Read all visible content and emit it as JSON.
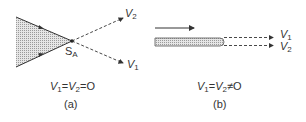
{
  "panels": [
    {
      "id": "a",
      "caption": "(a)",
      "equation": {
        "v1": "V",
        "v1_sub": "1",
        "eq1": "=",
        "v2": "V",
        "v2_sub": "2",
        "eq2": "=",
        "rhs": "O"
      },
      "point_label": {
        "main": "S",
        "sub": "A"
      },
      "line_labels": {
        "upper": {
          "main": "V",
          "sub": "2"
        },
        "lower": {
          "main": "V",
          "sub": "1"
        }
      }
    },
    {
      "id": "b",
      "caption": "(b)",
      "equation": {
        "v1": "V",
        "v1_sub": "1",
        "eq1": "=",
        "v2": "V",
        "v2_sub": "2",
        "eq2": "≠",
        "rhs": "O"
      },
      "line_labels": {
        "upper": {
          "main": "V",
          "sub": "1"
        },
        "lower": {
          "main": "V",
          "sub": "2"
        }
      }
    }
  ],
  "colors": {
    "stroke": "#333333",
    "fill": "#cfcfcf"
  }
}
